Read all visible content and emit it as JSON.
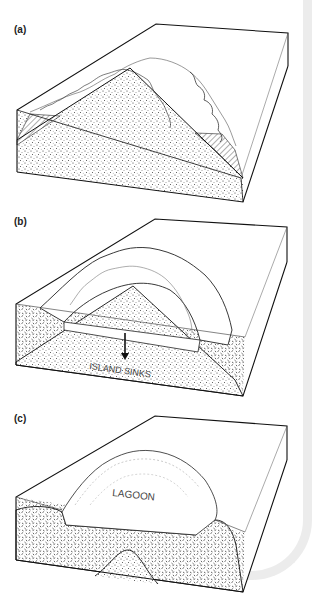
{
  "figure": {
    "panels": [
      {
        "id": "a",
        "label": "(a)",
        "annotation": ""
      },
      {
        "id": "b",
        "label": "(b)",
        "annotation": "ISLAND SINKS"
      },
      {
        "id": "c",
        "label": "(c)",
        "annotation": "LAGOON"
      }
    ]
  },
  "colors": {
    "ink": "#1a1a1a",
    "frame": "#ececec",
    "background": "#ffffff"
  }
}
